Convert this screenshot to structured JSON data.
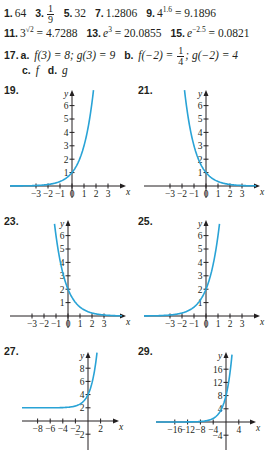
{
  "answers": {
    "line1": [
      {
        "num": "1.",
        "text": "64"
      },
      {
        "num": "3.",
        "frac_num": "1",
        "frac_den": "9"
      },
      {
        "num": "5.",
        "text": "32"
      },
      {
        "num": "7.",
        "text": "1.2806"
      },
      {
        "num": "9.",
        "base": "4",
        "exp": "1.6",
        "rest": " = 9.1896"
      }
    ],
    "line2": [
      {
        "num": "11.",
        "base": "3",
        "exp": "√2",
        "rest": " = 4.7288"
      },
      {
        "num": "13.",
        "base": "e",
        "exp": "3",
        "rest": " = 20.0855"
      },
      {
        "num": "15.",
        "base": "e",
        "exp": "−2.5",
        "rest": " = 0.0821"
      }
    ],
    "line3": {
      "num": "17.",
      "a_label": "a.",
      "a_text": "f(3) = 8; g(3) = 9",
      "b_label": "b.",
      "b_pre": "f(−2) = ",
      "b_frac_num": "1",
      "b_frac_den": "4",
      "b_post": "; g(−2) = 4"
    },
    "line4": {
      "c_label": "c.",
      "c_text": "f",
      "d_label": "d.",
      "d_text": "g"
    }
  },
  "chart_data": [
    {
      "label": "19.",
      "type": "line",
      "curve_color": "#29a3d6",
      "function": "3^x",
      "xlabel": "x",
      "ylabel": "y",
      "xticks": [
        -3,
        -2,
        -1,
        0,
        1,
        2,
        3
      ],
      "xtick_labels": [
        "−3",
        "−2",
        "−1",
        "0",
        "1",
        "2",
        "3"
      ],
      "yticks": [
        1,
        2,
        3,
        4,
        5,
        6
      ],
      "ytick_labels": [
        "1",
        "2",
        "3",
        "4",
        "5",
        "6"
      ],
      "xlim": [
        -3.5,
        3.5
      ],
      "ylim": [
        0,
        7
      ],
      "asymptote": 0
    },
    {
      "label": "21.",
      "type": "line",
      "curve_color": "#29a3d6",
      "function": "3^(-x)",
      "xlabel": "x",
      "ylabel": "y",
      "xticks": [
        -3,
        -2,
        -1,
        0,
        1,
        2,
        3
      ],
      "xtick_labels": [
        "−3",
        "−2",
        "−1",
        "0",
        "1",
        "2",
        "3"
      ],
      "yticks": [
        1,
        2,
        3,
        4,
        5,
        6
      ],
      "ytick_labels": [
        "1",
        "2",
        "3",
        "4",
        "5",
        "6"
      ],
      "xlim": [
        -3.5,
        3.5
      ],
      "ylim": [
        0,
        7
      ],
      "asymptote": 0
    },
    {
      "label": "23.",
      "type": "line",
      "curve_color": "#29a3d6",
      "function": "2·(1/3)^x",
      "xlabel": "x",
      "ylabel": "y",
      "xticks": [
        -3,
        -2,
        -1,
        0,
        1,
        2,
        3
      ],
      "xtick_labels": [
        "−3",
        "−2",
        "−1",
        "0",
        "1",
        "2",
        "3"
      ],
      "yticks": [
        1,
        2,
        3,
        4,
        5,
        6
      ],
      "ytick_labels": [
        "1",
        "2",
        "3",
        "4",
        "5",
        "6"
      ],
      "xlim": [
        -3.5,
        3.5
      ],
      "ylim": [
        0,
        7
      ],
      "asymptote": 0
    },
    {
      "label": "25.",
      "type": "line",
      "curve_color": "#29a3d6",
      "function": "2·3^x",
      "xlabel": "x",
      "ylabel": "y",
      "xticks": [
        -3,
        -2,
        -1,
        0,
        1,
        2,
        3
      ],
      "xtick_labels": [
        "−3",
        "−2",
        "−1",
        "0",
        "1",
        "2",
        "3"
      ],
      "yticks": [
        1,
        2,
        3,
        4,
        5,
        6
      ],
      "ytick_labels": [
        "1",
        "2",
        "3",
        "4",
        "5",
        "6"
      ],
      "xlim": [
        -3.5,
        3.5
      ],
      "ylim": [
        0,
        7
      ],
      "asymptote": 0
    },
    {
      "label": "27.",
      "type": "line",
      "curve_color": "#29a3d6",
      "function": "2 + 2·e^x",
      "xlabel": "x",
      "ylabel": "y",
      "xticks": [
        -8,
        -6,
        -4,
        -2,
        2
      ],
      "xtick_labels": [
        "−8",
        "−6",
        "−4",
        "−2",
        "2"
      ],
      "yticks": [
        -2,
        2,
        4,
        6,
        8
      ],
      "ytick_labels": [
        "−2",
        "2",
        "4",
        "6",
        "8"
      ],
      "xlim": [
        -9.5,
        3.5
      ],
      "ylim": [
        -4,
        10
      ],
      "asymptote": 2
    },
    {
      "label": "29.",
      "type": "line",
      "curve_color": "#29a3d6",
      "function": "8·e^(x/2)",
      "xlabel": "x",
      "ylabel": "y",
      "xticks": [
        -16,
        -12,
        -8,
        -4,
        4
      ],
      "xtick_labels": [
        "−16",
        "−12",
        "−8",
        "−4",
        "4"
      ],
      "yticks": [
        -4,
        4,
        8,
        12,
        16
      ],
      "ytick_labels": [
        "−4",
        "4",
        "8",
        "12",
        "16"
      ],
      "xlim": [
        -19,
        7
      ],
      "ylim": [
        -7,
        20
      ],
      "asymptote": 0
    }
  ]
}
